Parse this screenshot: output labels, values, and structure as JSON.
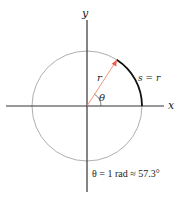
{
  "diagram": {
    "axes": {
      "x_label": "x",
      "y_label": "y"
    },
    "circle": {
      "center": [
        87,
        106
      ],
      "radius": 55,
      "stroke": "#9a9a9a"
    },
    "radius_line": {
      "label": "r",
      "color": "#f08a6a"
    },
    "arc": {
      "label": "s = r",
      "color": "#111111"
    },
    "angle": {
      "label": "θ"
    },
    "caption": "θ = 1 rad ≈ 57.3°"
  }
}
